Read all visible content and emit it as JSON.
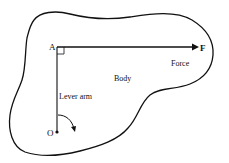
{
  "diagram": {
    "points": {
      "A": "A",
      "F": "F",
      "O": "O"
    },
    "labels": {
      "body": "Body",
      "force": "Force",
      "lever_arm": "Lever arm"
    },
    "colors": {
      "ink": "#111111",
      "background": "#ffffff"
    }
  }
}
